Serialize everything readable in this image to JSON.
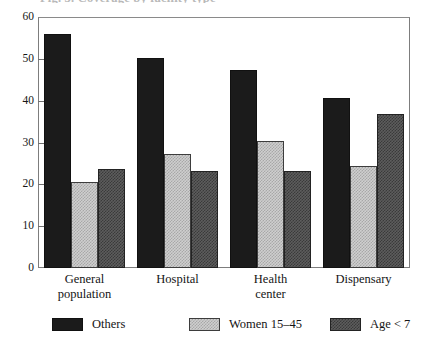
{
  "figure": {
    "clipped_title": "Fig. 3. Coverage by facility type",
    "background_color": "#ffffff"
  },
  "chart_data": {
    "type": "bar",
    "title": "",
    "xlabel": "",
    "ylabel": "",
    "ylim": [
      0,
      60
    ],
    "yticks": [
      0,
      10,
      20,
      30,
      40,
      50,
      60
    ],
    "ytick_labels": [
      "0",
      "10",
      "20",
      "30",
      "40",
      "50",
      "60"
    ],
    "grid": false,
    "legend_position": "bottom",
    "categories": [
      "General population",
      "Hospital",
      "Health center",
      "Dispensary"
    ],
    "category_lines": [
      [
        "General",
        "population"
      ],
      [
        "Hospital",
        ""
      ],
      [
        "Health",
        "center"
      ],
      [
        "Dispensary",
        ""
      ]
    ],
    "series": [
      {
        "name": "Others",
        "color": "#1b1b1b",
        "pattern": "solid",
        "values": [
          56.0,
          50.3,
          47.3,
          40.6
        ]
      },
      {
        "name": "Women 15–45",
        "color": "#cfcfcf",
        "pattern": "fine-checker-light",
        "values": [
          20.6,
          27.3,
          30.4,
          24.5
        ]
      },
      {
        "name": "Age < 7",
        "color": "#5d5d5d",
        "pattern": "fine-checker-dark",
        "values": [
          23.7,
          23.2,
          23.3,
          36.8
        ]
      }
    ]
  }
}
